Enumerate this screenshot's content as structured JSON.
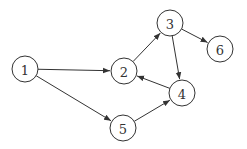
{
  "graph": {
    "type": "directed",
    "node_radius": 13,
    "colors": {
      "stroke": "#333333",
      "fill": "#ffffff",
      "background": "#ffffff"
    },
    "nodes": [
      {
        "id": "1",
        "label": "1",
        "x": 25,
        "y": 69
      },
      {
        "id": "2",
        "label": "2",
        "x": 124,
        "y": 71
      },
      {
        "id": "3",
        "label": "3",
        "x": 170,
        "y": 23
      },
      {
        "id": "4",
        "label": "4",
        "x": 182,
        "y": 93
      },
      {
        "id": "5",
        "label": "5",
        "x": 123,
        "y": 128
      },
      {
        "id": "6",
        "label": "6",
        "x": 220,
        "y": 49
      }
    ],
    "edges": [
      {
        "from": "1",
        "to": "2"
      },
      {
        "from": "1",
        "to": "5"
      },
      {
        "from": "2",
        "to": "3"
      },
      {
        "from": "3",
        "to": "4"
      },
      {
        "from": "3",
        "to": "6"
      },
      {
        "from": "4",
        "to": "2"
      },
      {
        "from": "5",
        "to": "4"
      }
    ]
  }
}
